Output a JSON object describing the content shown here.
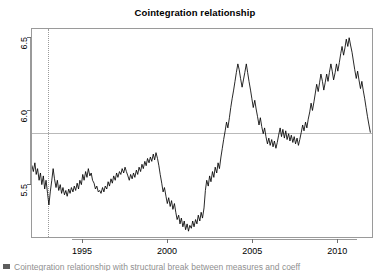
{
  "chart": {
    "title": "Cointegration relationship",
    "caption": "Cointegration relationship with structural break between measures and coeff"
  },
  "axes": {
    "y_ticks": [
      "5.5",
      "6.0",
      "6.5"
    ],
    "x_ticks": [
      "1995",
      "2000",
      "2005",
      "2010"
    ]
  },
  "chart_data": {
    "type": "line",
    "title": "Cointegration relationship",
    "xlabel": "",
    "ylabel": "",
    "xlim": [
      1992.0,
      2012.1
    ],
    "ylim": [
      5.13,
      6.56
    ],
    "grid": false,
    "legend": null,
    "yticks": [
      5.5,
      6.0,
      6.5
    ],
    "xticks": [
      1995,
      2000,
      2005,
      2010
    ],
    "annotations": [
      {
        "kind": "vline",
        "style": "dotted",
        "color": "#9a9a9a",
        "x": 1992.95,
        "label": "structural break"
      },
      {
        "kind": "hline",
        "style": "solid",
        "color": "#b9b9b9",
        "y": 5.85,
        "label": "mean level"
      }
    ],
    "series": [
      {
        "name": "cointegration residual",
        "color": "#000000",
        "x": [
          1992.0,
          1992.08,
          1992.17,
          1992.25,
          1992.33,
          1992.42,
          1992.5,
          1992.58,
          1992.67,
          1992.75,
          1992.83,
          1992.92,
          1993.0,
          1993.08,
          1993.17,
          1993.25,
          1993.33,
          1993.42,
          1993.5,
          1993.58,
          1993.67,
          1993.75,
          1993.83,
          1993.92,
          1994.0,
          1994.08,
          1994.17,
          1994.25,
          1994.33,
          1994.42,
          1994.5,
          1994.58,
          1994.67,
          1994.75,
          1994.83,
          1994.92,
          1995.0,
          1995.08,
          1995.17,
          1995.25,
          1995.33,
          1995.42,
          1995.5,
          1995.58,
          1995.67,
          1995.75,
          1995.83,
          1995.92,
          1996.0,
          1996.08,
          1996.17,
          1996.25,
          1996.33,
          1996.42,
          1996.5,
          1996.58,
          1996.67,
          1996.75,
          1996.83,
          1996.92,
          1997.0,
          1997.08,
          1997.17,
          1997.25,
          1997.33,
          1997.42,
          1997.5,
          1997.58,
          1997.67,
          1997.75,
          1997.83,
          1997.92,
          1998.0,
          1998.08,
          1998.17,
          1998.25,
          1998.33,
          1998.42,
          1998.5,
          1998.58,
          1998.67,
          1998.75,
          1998.83,
          1998.92,
          1999.0,
          1999.08,
          1999.17,
          1999.25,
          1999.33,
          1999.42,
          1999.5,
          1999.58,
          1999.67,
          1999.75,
          1999.83,
          1999.92,
          2000.0,
          2000.08,
          2000.17,
          2000.25,
          2000.33,
          2000.42,
          2000.5,
          2000.58,
          2000.67,
          2000.75,
          2000.83,
          2000.92,
          2001.0,
          2001.08,
          2001.17,
          2001.25,
          2001.33,
          2001.42,
          2001.5,
          2001.58,
          2001.67,
          2001.75,
          2001.83,
          2001.92,
          2002.0,
          2002.08,
          2002.17,
          2002.25,
          2002.33,
          2002.42,
          2002.5,
          2002.58,
          2002.67,
          2002.75,
          2002.83,
          2002.92,
          2003.0,
          2003.08,
          2003.17,
          2003.25,
          2003.33,
          2003.42,
          2003.5,
          2003.58,
          2003.67,
          2003.75,
          2003.83,
          2003.92,
          2004.0,
          2004.08,
          2004.17,
          2004.25,
          2004.33,
          2004.42,
          2004.5,
          2004.58,
          2004.67,
          2004.75,
          2004.83,
          2004.92,
          2005.0,
          2005.08,
          2005.17,
          2005.25,
          2005.33,
          2005.42,
          2005.5,
          2005.58,
          2005.67,
          2005.75,
          2005.83,
          2005.92,
          2006.0,
          2006.08,
          2006.17,
          2006.25,
          2006.33,
          2006.42,
          2006.5,
          2006.58,
          2006.67,
          2006.75,
          2006.83,
          2006.92,
          2007.0,
          2007.08,
          2007.17,
          2007.25,
          2007.33,
          2007.42,
          2007.5,
          2007.58,
          2007.67,
          2007.75,
          2007.83,
          2007.92,
          2008.0,
          2008.08,
          2008.17,
          2008.25,
          2008.33,
          2008.42,
          2008.5,
          2008.58,
          2008.67,
          2008.75,
          2008.83,
          2008.92,
          2009.0,
          2009.08,
          2009.17,
          2009.25,
          2009.33,
          2009.42,
          2009.5,
          2009.58,
          2009.67,
          2009.75,
          2009.83,
          2009.92,
          2010.0,
          2010.08,
          2010.17,
          2010.25,
          2010.33,
          2010.42,
          2010.5,
          2010.58,
          2010.67,
          2010.75,
          2010.83,
          2010.92,
          2011.0,
          2011.08,
          2011.17,
          2011.25,
          2011.33,
          2011.42,
          2011.5,
          2011.58,
          2011.67,
          2011.75,
          2011.83,
          2011.92,
          2012.0
        ],
        "y": [
          5.62,
          5.58,
          5.64,
          5.56,
          5.6,
          5.52,
          5.57,
          5.49,
          5.55,
          5.46,
          5.52,
          5.43,
          5.35,
          5.44,
          5.52,
          5.6,
          5.53,
          5.47,
          5.52,
          5.45,
          5.49,
          5.43,
          5.47,
          5.42,
          5.45,
          5.41,
          5.46,
          5.43,
          5.47,
          5.44,
          5.48,
          5.45,
          5.5,
          5.46,
          5.52,
          5.49,
          5.56,
          5.52,
          5.58,
          5.54,
          5.6,
          5.55,
          5.57,
          5.52,
          5.5,
          5.46,
          5.48,
          5.44,
          5.45,
          5.43,
          5.47,
          5.44,
          5.48,
          5.46,
          5.51,
          5.48,
          5.53,
          5.5,
          5.55,
          5.52,
          5.57,
          5.54,
          5.58,
          5.56,
          5.6,
          5.57,
          5.61,
          5.58,
          5.55,
          5.52,
          5.56,
          5.53,
          5.57,
          5.54,
          5.59,
          5.56,
          5.61,
          5.58,
          5.63,
          5.6,
          5.65,
          5.62,
          5.67,
          5.64,
          5.68,
          5.65,
          5.7,
          5.66,
          5.71,
          5.67,
          5.62,
          5.56,
          5.5,
          5.44,
          5.47,
          5.41,
          5.36,
          5.4,
          5.34,
          5.38,
          5.32,
          5.36,
          5.3,
          5.25,
          5.28,
          5.22,
          5.26,
          5.2,
          5.24,
          5.18,
          5.22,
          5.17,
          5.21,
          5.19,
          5.24,
          5.2,
          5.25,
          5.22,
          5.28,
          5.24,
          5.3,
          5.26,
          5.33,
          5.45,
          5.52,
          5.48,
          5.55,
          5.51,
          5.58,
          5.54,
          5.61,
          5.57,
          5.64,
          5.6,
          5.68,
          5.74,
          5.8,
          5.86,
          5.92,
          5.88,
          5.95,
          6.02,
          6.08,
          6.14,
          6.2,
          6.26,
          6.32,
          6.28,
          6.22,
          6.16,
          6.21,
          6.26,
          6.32,
          6.26,
          6.2,
          6.14,
          6.08,
          6.02,
          6.07,
          6.01,
          5.96,
          5.9,
          5.95,
          5.89,
          5.84,
          5.88,
          5.82,
          5.77,
          5.81,
          5.76,
          5.8,
          5.75,
          5.79,
          5.74,
          5.78,
          5.83,
          5.88,
          5.82,
          5.87,
          5.81,
          5.86,
          5.8,
          5.84,
          5.79,
          5.83,
          5.78,
          5.82,
          5.77,
          5.81,
          5.76,
          5.8,
          5.85,
          5.9,
          5.86,
          5.92,
          5.88,
          5.94,
          5.99,
          6.05,
          6.0,
          6.06,
          6.12,
          6.18,
          6.13,
          6.19,
          6.25,
          6.2,
          6.14,
          6.19,
          6.25,
          6.2,
          6.26,
          6.32,
          6.27,
          6.21,
          6.26,
          6.32,
          6.27,
          6.33,
          6.39,
          6.44,
          6.38,
          6.43,
          6.49,
          6.44,
          6.5,
          6.45,
          6.4,
          6.34,
          6.28,
          6.22,
          6.27,
          6.21,
          6.15,
          6.2,
          6.14,
          6.08,
          6.02,
          5.96,
          5.9,
          5.85
        ]
      }
    ]
  }
}
